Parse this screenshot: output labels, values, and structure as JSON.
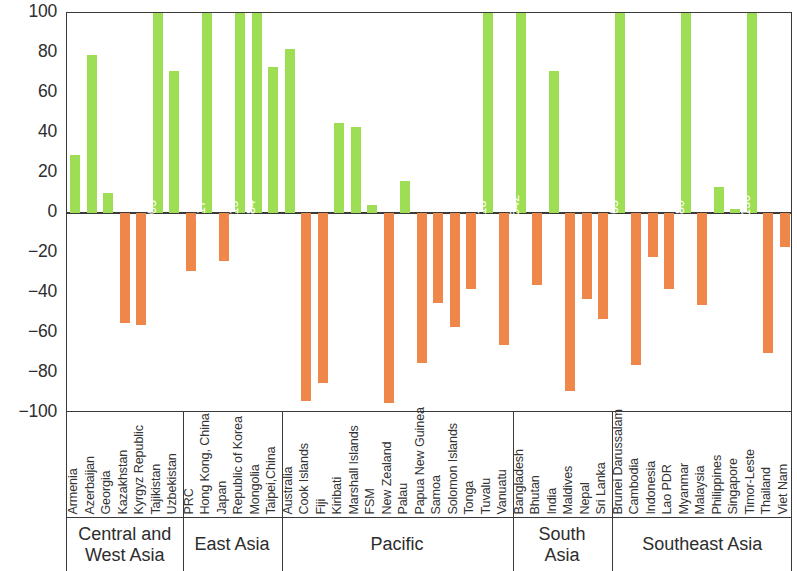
{
  "chart_data": {
    "type": "bar",
    "title": "",
    "xlabel": "",
    "ylabel": "",
    "ylim": [
      -100,
      100
    ],
    "grid": false,
    "legend": "none",
    "colors": {
      "positive": "#9ede54",
      "negative": "#f0874a",
      "axis": "#3a3a3a",
      "label_text": "#ffffff"
    },
    "y_ticks": [
      "100",
      "80",
      "60",
      "40",
      "20",
      "0",
      "-20",
      "-40",
      "-60",
      "-80",
      "-100"
    ],
    "y_tick_values": [
      100,
      80,
      60,
      40,
      20,
      0,
      -20,
      -40,
      -60,
      -80,
      -100
    ],
    "groups": [
      {
        "name": "Central and\nWest Asia",
        "count": 7
      },
      {
        "name": "East Asia",
        "count": 6
      },
      {
        "name": "Pacific",
        "count": 14
      },
      {
        "name": "South\nAsia",
        "count": 6
      },
      {
        "name": "Southeast Asia",
        "count": 11
      }
    ],
    "categories": [
      "Armenia",
      "Azerbaijan",
      "Georgia",
      "Kazakhstan",
      "Kyrgyz Republic",
      "Tajikistan",
      "Uzbekistan",
      "PRC",
      "Hong Kong, China",
      "Japan",
      "Republic of Korea",
      "Mongolia",
      "Taipei,China",
      "Australia",
      "Cook Islands",
      "Fiji",
      "Kiribati",
      "Marshall Islands",
      "FSM",
      "New Zealand",
      "Palau",
      "Papua New Guinea",
      "Samoa",
      "Solomon Islands",
      "Tonga",
      "Tuvalu",
      "Vanuatu",
      "Bangladesh",
      "Bhutan",
      "India",
      "Maldives",
      "Nepal",
      "Sri Lanka",
      "Brunei Darussalam",
      "Cambodia",
      "Indonesia",
      "Lao PDR",
      "Myanmar",
      "Malaysia",
      "Philippines",
      "Singapore",
      "Timor-Leste",
      "Thailand",
      "Viet Nam"
    ],
    "values": [
      29,
      79,
      10,
      -55,
      -56,
      103,
      71,
      -29,
      217,
      -24,
      115,
      384,
      73,
      82,
      -94,
      -85,
      45,
      43,
      4,
      -95,
      16,
      -75,
      -45,
      -57,
      -38,
      118,
      -66,
      3542,
      -36,
      71,
      -89,
      -43,
      -53,
      463,
      -76,
      -22,
      -38,
      280,
      -46,
      13,
      2,
      3130,
      -70,
      -17
    ],
    "value_labels": {
      "5": "103",
      "8": "217",
      "10": "115",
      "11": "384",
      "25": "118",
      "27": "3,542",
      "33": "463",
      "37": "280",
      "41": "3,130"
    }
  }
}
